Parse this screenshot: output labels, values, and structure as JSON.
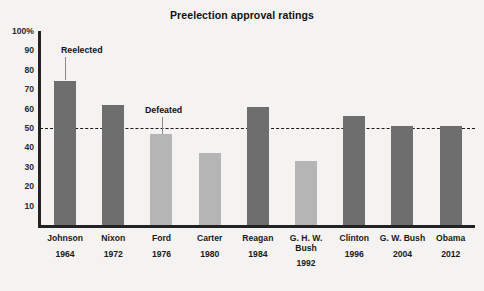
{
  "chart_data": {
    "type": "bar",
    "title": "Preelection approval ratings",
    "xlabel": "",
    "ylabel": "",
    "ylim": [
      0,
      100
    ],
    "grid": false,
    "legend": "none",
    "categories": [
      "Johnson",
      "Nixon",
      "Ford",
      "Carter",
      "Reagan",
      "G. H. W. Bush",
      "Clinton",
      "G. W. Bush",
      "Obama"
    ],
    "years": [
      "1964",
      "1972",
      "1976",
      "1980",
      "1984",
      "1992",
      "1996",
      "2004",
      "2012"
    ],
    "values": [
      74,
      62,
      47,
      37,
      61,
      33,
      56,
      51,
      51
    ],
    "outcomes": [
      "reelected",
      "reelected",
      "defeated",
      "defeated",
      "reelected",
      "defeated",
      "reelected",
      "reelected",
      "reelected"
    ],
    "reference_line": {
      "value": 50,
      "style": "dashed",
      "color": "#1a1a1a"
    },
    "ytick_labels": [
      "100%",
      "90",
      "80",
      "70",
      "60",
      "50",
      "40",
      "30",
      "20",
      "10"
    ],
    "ytick_values": [
      100,
      90,
      80,
      70,
      60,
      50,
      40,
      30,
      20,
      10
    ],
    "annotations": [
      {
        "label": "Reelected",
        "target": "Johnson"
      },
      {
        "label": "Defeated",
        "target": "Ford"
      }
    ],
    "colors": {
      "reelected_bar": "#6f6e6e",
      "defeated_bar": "#b5b5b5",
      "axis": "#222222",
      "background": "#f4f3f1"
    }
  },
  "caption": ""
}
